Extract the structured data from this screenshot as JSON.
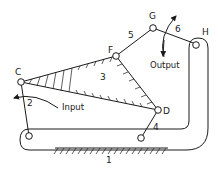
{
  "diagram": {
    "type": "six-bar linkage mechanism",
    "joints": {
      "C": {
        "label": "C"
      },
      "D": {
        "label": "D"
      },
      "F": {
        "label": "F"
      },
      "G": {
        "label": "G"
      },
      "H": {
        "label": "H"
      }
    },
    "links": {
      "ground": {
        "label": "1"
      },
      "input_crank": {
        "label": "2"
      },
      "coupler": {
        "label": "3"
      },
      "rocker": {
        "label": "4"
      },
      "link5": {
        "label": "5"
      },
      "output_link": {
        "label": "6"
      }
    },
    "annotations": {
      "input": "Input",
      "output": "Output"
    },
    "colors": {
      "stroke": "#1a1a1a",
      "background": "#ffffff"
    }
  }
}
